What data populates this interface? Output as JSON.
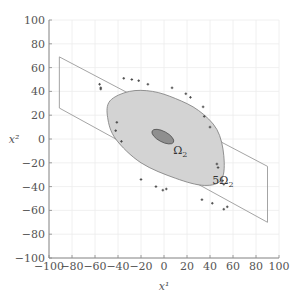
{
  "chart_data": {
    "type": "scatter",
    "title": "",
    "xlabel": "x¹",
    "ylabel": "x²",
    "xlim": [
      -100,
      100
    ],
    "ylim": [
      -100,
      100
    ],
    "grid": true,
    "x_ticks": [
      -100,
      -80,
      -60,
      -40,
      -20,
      0,
      20,
      40,
      60,
      80,
      100
    ],
    "y_ticks": [
      -100,
      -80,
      -60,
      -40,
      -20,
      0,
      20,
      40,
      60,
      80,
      100
    ],
    "x_tick_labels": [
      "−100",
      "−80",
      "−60",
      "−40",
      "−20",
      "0",
      "20",
      "40",
      "60",
      "80",
      "100"
    ],
    "y_tick_labels": [
      "−100",
      "−80",
      "−60",
      "−40",
      "−20",
      "0",
      "20",
      "40",
      "60",
      "80",
      "100"
    ],
    "parallelogram": [
      [
        -91,
        69
      ],
      [
        90,
        -23
      ],
      [
        90,
        -70
      ],
      [
        -91,
        26
      ]
    ],
    "regions": [
      {
        "name": "5Ω₂",
        "label": "5Ω",
        "label_sub": "2",
        "fill": "#d3d3d3",
        "stroke": "#7a7a7a",
        "outline": [
          [
            -47,
            32
          ],
          [
            -30,
            40
          ],
          [
            -10,
            40
          ],
          [
            10,
            34
          ],
          [
            30,
            24
          ],
          [
            46,
            8
          ],
          [
            52,
            -14
          ],
          [
            50,
            -34
          ],
          [
            35,
            -39
          ],
          [
            10,
            -33
          ],
          [
            -20,
            -20
          ],
          [
            -42,
            0
          ],
          [
            -49,
            18
          ]
        ]
      },
      {
        "name": "Ω₂",
        "label": "Ω",
        "label_sub": "2",
        "fill": "#8f8f8f",
        "stroke": "#555555",
        "center": [
          -1,
          2
        ],
        "rx": 10.5,
        "ry": 4.4,
        "rotation_deg": 28
      }
    ],
    "points": [
      [
        -56,
        46
      ],
      [
        -55,
        43
      ],
      [
        -55,
        42
      ],
      [
        -35,
        51
      ],
      [
        -28,
        50
      ],
      [
        -22,
        49
      ],
      [
        -14,
        46
      ],
      [
        7,
        43
      ],
      [
        19,
        38
      ],
      [
        23,
        35
      ],
      [
        34,
        27
      ],
      [
        35,
        19
      ],
      [
        40,
        10
      ],
      [
        -41,
        14
      ],
      [
        -42,
        7
      ],
      [
        -37,
        -2
      ],
      [
        46,
        -21
      ],
      [
        47,
        -24
      ],
      [
        51,
        -35
      ],
      [
        52,
        -38
      ],
      [
        -20,
        -34
      ],
      [
        -7,
        -40
      ],
      [
        -1,
        -43
      ],
      [
        2,
        -42
      ],
      [
        33,
        -51
      ],
      [
        42,
        -54
      ],
      [
        52,
        -59
      ],
      [
        55,
        -57
      ]
    ],
    "annotations": [
      {
        "text": "Ω",
        "sub": "2",
        "x": 8,
        "y": -13
      },
      {
        "text": "5Ω",
        "sub": "2",
        "x": 42,
        "y": -38
      }
    ],
    "colors": {
      "axis": "#888888",
      "grid": "#ececec",
      "parallelogram": "#9a9a9a",
      "points": "#444444"
    }
  }
}
